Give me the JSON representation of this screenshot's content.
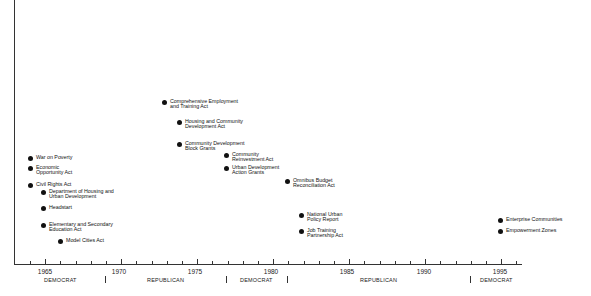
{
  "timeline": {
    "axis": {
      "start_year": 1963,
      "end_year": 1996,
      "x_1964": 30,
      "px_per_year": 15.2
    },
    "year_labels": [
      {
        "year": "1965",
        "x": 45
      },
      {
        "year": "1970",
        "x": 119
      },
      {
        "year": "1975",
        "x": 195
      },
      {
        "year": "1980",
        "x": 271
      },
      {
        "year": "1985",
        "x": 347
      },
      {
        "year": "1990",
        "x": 424
      },
      {
        "year": "1995",
        "x": 500
      }
    ],
    "party_periods": [
      {
        "label": "DEMOCRAT",
        "x": 44
      },
      {
        "label": "REPUBLICAN",
        "x": 147
      },
      {
        "label": "DEMOCRAT",
        "x": 240
      },
      {
        "label": "REPUBLICAN",
        "x": 360
      },
      {
        "label": "DEMOCRAT",
        "x": 480
      }
    ],
    "party_separators": [
      105,
      226,
      287,
      470
    ],
    "events": [
      {
        "label": "War on Poverty",
        "x": 28,
        "y": 155
      },
      {
        "label": "Economic\nOpportunity Act",
        "x": 28,
        "y": 165
      },
      {
        "label": "Civil Rights Act",
        "x": 28,
        "y": 182
      },
      {
        "label": "Department of Housing and\nUrban Development",
        "x": 41,
        "y": 189
      },
      {
        "label": "Headstart",
        "x": 41,
        "y": 205
      },
      {
        "label": "Elementary and Secondary\nEducation Act",
        "x": 41,
        "y": 222
      },
      {
        "label": "Model Cities Act",
        "x": 58,
        "y": 238
      },
      {
        "label": "Comprehensive Employment\nand Training Act",
        "x": 162,
        "y": 99
      },
      {
        "label": "Housing and Community\nDevelopment Act",
        "x": 177,
        "y": 119
      },
      {
        "label": "Community Development\nBlock Grants",
        "x": 177,
        "y": 141
      },
      {
        "label": "Community\nReinvestment Act",
        "x": 224,
        "y": 152
      },
      {
        "label": "Urban Development\nAction Grants",
        "x": 224,
        "y": 165
      },
      {
        "label": "Omnibus Budget\nReconciliation Act",
        "x": 285,
        "y": 178
      },
      {
        "label": "National Urban\nPolicy Report",
        "x": 299,
        "y": 212
      },
      {
        "label": "Job Training\nPartnership Act",
        "x": 299,
        "y": 228
      },
      {
        "label": "Enterprise Communities",
        "x": 498,
        "y": 217
      },
      {
        "label": "Empowerment Zones",
        "x": 498,
        "y": 228
      }
    ]
  }
}
